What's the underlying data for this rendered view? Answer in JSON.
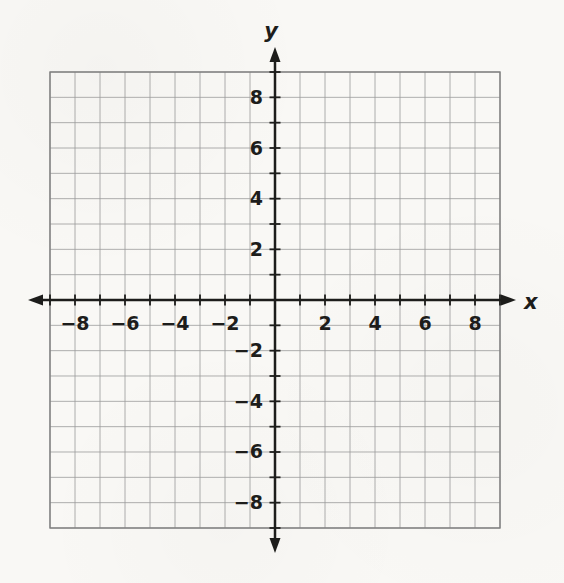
{
  "chart_data": {
    "type": "scatter",
    "title": "",
    "xlabel": "x",
    "ylabel": "y",
    "xlim": [
      -9,
      9
    ],
    "ylim": [
      -9,
      9
    ],
    "grid": true,
    "grid_step": 1,
    "tick_step": 1,
    "x_tick_values": [
      -8,
      -6,
      -4,
      -2,
      2,
      4,
      6,
      8
    ],
    "x_tick_labels": [
      "−8",
      "−6",
      "−4",
      "−2",
      "2",
      "4",
      "6",
      "8"
    ],
    "y_tick_values": [
      -8,
      -6,
      -4,
      -2,
      2,
      4,
      6,
      8
    ],
    "y_tick_labels": [
      "−8",
      "−6",
      "−4",
      "−2",
      "2",
      "4",
      "6",
      "8"
    ],
    "series": [],
    "points": [],
    "legend": null,
    "colors": {
      "paper": "#f9f8f5",
      "grid": "#9a9a9a",
      "border": "#7f7f7f",
      "axis": "#1d1d1b",
      "text": "#1d1d1b"
    }
  }
}
